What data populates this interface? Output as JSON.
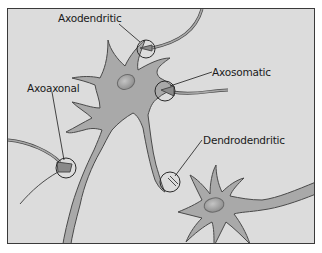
{
  "figure": {
    "colors": {
      "background": "#dcdcdc",
      "frame": "#3a3a3a",
      "neuron_fill": "#a9a9a9",
      "neuron_outline": "#4a4a4a",
      "nucleus": "#959595",
      "label_text": "#1a1a1a"
    },
    "labels": [
      {
        "id": "axodendritic",
        "text": "Axodendritic"
      },
      {
        "id": "axosomatic",
        "text": "Axosomatic"
      },
      {
        "id": "axoaxonal",
        "text": "Axoaxonal"
      },
      {
        "id": "dendrodendritic",
        "text": "Dendrodendritic"
      }
    ]
  }
}
